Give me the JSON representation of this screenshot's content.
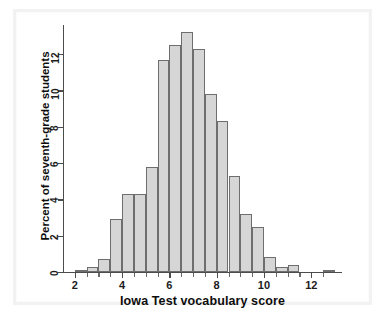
{
  "chart_data": {
    "type": "bar",
    "title": "",
    "subtitle": "",
    "xlabel": "Iowa Test vocabulary score",
    "ylabel": "Percent of seventh-grade students",
    "xlim": [
      1.5,
      13.3
    ],
    "ylim": [
      0,
      13.6
    ],
    "grid": false,
    "legend": null,
    "bin_width": 0.5,
    "xticks": [
      2,
      4,
      6,
      8,
      10,
      12
    ],
    "xtick_labels": [
      "2",
      "4",
      "6",
      "8",
      "10",
      "12"
    ],
    "xticks_minor": [
      2.5,
      3,
      3.5,
      4.5,
      5,
      5.5,
      6.5,
      7,
      7.5,
      8.5,
      9,
      9.5,
      10.5,
      11,
      11.5,
      12.5
    ],
    "yticks": [
      0,
      2,
      4,
      6,
      8,
      10,
      12
    ],
    "ytick_labels": [
      "0",
      "2",
      "4",
      "6",
      "8",
      "10",
      "12"
    ],
    "bin_starts": [
      2.0,
      2.5,
      3.0,
      3.5,
      4.0,
      4.5,
      5.0,
      5.5,
      6.0,
      6.5,
      7.0,
      7.5,
      8.0,
      8.5,
      9.0,
      9.5,
      10.0,
      10.5,
      11.0,
      11.5,
      12.0,
      12.5
    ],
    "categories": [
      "2.0-2.5",
      "2.5-3.0",
      "3.0-3.5",
      "3.5-4.0",
      "4.0-4.5",
      "4.5-5.0",
      "5.0-5.5",
      "5.5-6.0",
      "6.0-6.5",
      "6.5-7.0",
      "7.0-7.5",
      "7.5-8.0",
      "8.0-8.5",
      "8.5-9.0",
      "9.0-9.5",
      "9.5-10.0",
      "10.0-10.5",
      "10.5-11.0",
      "11.0-11.5",
      "11.5-12.0",
      "12.0-12.5",
      "12.5-13.0"
    ],
    "values": [
      0.1,
      0.3,
      0.7,
      2.9,
      4.3,
      4.3,
      5.8,
      11.7,
      12.5,
      13.2,
      12.3,
      9.8,
      8.3,
      5.3,
      3.2,
      2.5,
      0.8,
      0.3,
      0.4,
      0.0,
      0.0,
      0.1
    ],
    "bar_fill_color": "#d6d6d6",
    "bar_edge_color": "#6e6e6e",
    "axis_color": "#4c4c4c"
  }
}
